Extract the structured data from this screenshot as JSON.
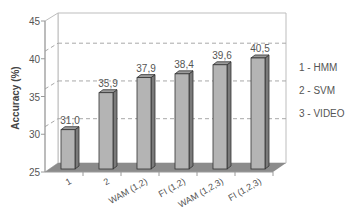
{
  "chart_data": {
    "type": "bar",
    "title": "",
    "xlabel": "",
    "ylabel": "Accuracy (%)",
    "ylim": [
      25,
      45
    ],
    "yticks": [
      25,
      30,
      35,
      40,
      45
    ],
    "grid": "dashed horizontal lines at 31.0, 36.0, 41.0 (legend reference lines)",
    "categories": [
      "1",
      "2",
      "WAM (1,2)",
      "FI (1,2)",
      "WAM (1,2,3)",
      "FI (1,2,3)"
    ],
    "values": [
      31.0,
      35.9,
      37.9,
      38.4,
      39.6,
      40.5
    ],
    "value_labels": [
      "31,0",
      "35,9",
      "37,9",
      "38,4",
      "39,6",
      "40,5"
    ],
    "legend": [
      "1 - HMM",
      "2 - SVM",
      "3 - VIDEO"
    ],
    "legend_position": "right",
    "style": "3D grey bars"
  },
  "colors": {
    "bar_front": "#b4b4b4",
    "bar_side": "#7a7a7a",
    "bar_top": "#9a9a9a",
    "floor": "#8c8c8c",
    "text": "#555555"
  }
}
